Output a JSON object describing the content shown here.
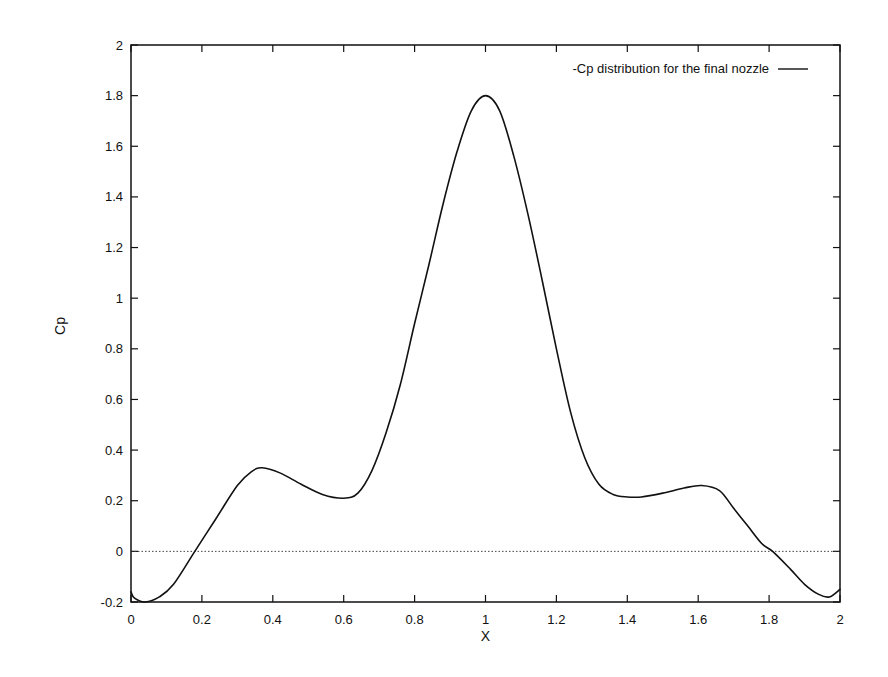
{
  "chart_data": {
    "type": "line",
    "title": "",
    "xlabel": "X",
    "ylabel": "Cp",
    "xlim": [
      0,
      2
    ],
    "ylim": [
      -0.2,
      2
    ],
    "grid": false,
    "legend_position": "top-right",
    "x_ticks": [
      "0",
      "0.2",
      "0.4",
      "0.6",
      "0.8",
      "1",
      "1.2",
      "1.4",
      "1.6",
      "1.8",
      "2"
    ],
    "y_ticks": [
      "-0.2",
      "0",
      "0.2",
      "0.4",
      "0.6",
      "0.8",
      "1",
      "1.2",
      "1.4",
      "1.6",
      "1.8",
      "2"
    ],
    "reference_lines": [
      {
        "y": 0,
        "style": "dotted"
      }
    ],
    "series": [
      {
        "name": "-Cp distribution for the final nozzle",
        "color": "#111111",
        "x": [
          0.0,
          0.01,
          0.04,
          0.08,
          0.12,
          0.18,
          0.24,
          0.3,
          0.34,
          0.37,
          0.42,
          0.48,
          0.54,
          0.6,
          0.64,
          0.68,
          0.72,
          0.76,
          0.8,
          0.84,
          0.88,
          0.92,
          0.96,
          1.0,
          1.04,
          1.08,
          1.12,
          1.16,
          1.2,
          1.24,
          1.28,
          1.32,
          1.36,
          1.4,
          1.44,
          1.5,
          1.56,
          1.61,
          1.66,
          1.7,
          1.74,
          1.78,
          1.81,
          1.86,
          1.9,
          1.94,
          1.97,
          2.0
        ],
        "y": [
          -0.16,
          -0.185,
          -0.2,
          -0.18,
          -0.13,
          0.0,
          0.13,
          0.26,
          0.315,
          0.33,
          0.31,
          0.265,
          0.225,
          0.21,
          0.23,
          0.32,
          0.47,
          0.66,
          0.9,
          1.13,
          1.37,
          1.58,
          1.74,
          1.8,
          1.74,
          1.56,
          1.33,
          1.07,
          0.8,
          0.55,
          0.37,
          0.265,
          0.225,
          0.215,
          0.215,
          0.23,
          0.25,
          0.26,
          0.24,
          0.17,
          0.1,
          0.03,
          0.0,
          -0.07,
          -0.13,
          -0.17,
          -0.18,
          -0.15
        ]
      }
    ]
  }
}
